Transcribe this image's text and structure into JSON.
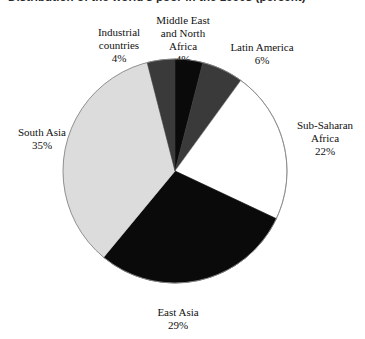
{
  "figure": {
    "title_clipped": "Distribution of the world's poor in the 1990s (percent)",
    "background_color": "#ffffff"
  },
  "chart_data": {
    "type": "pie",
    "title": "Distribution of the world's poor in the 1990s (percent)",
    "xlabel": "",
    "ylabel": "",
    "units": "percent",
    "total": 100,
    "start_angle_deg": 0,
    "direction": "clockwise",
    "legend": "none",
    "grid": false,
    "outline_color": "#888888",
    "categories": [
      "Middle East and North Africa",
      "Latin America",
      "Sub-Saharan Africa",
      "East Asia",
      "South Asia",
      "Industrial countries"
    ],
    "values": [
      4,
      6,
      22,
      29,
      35,
      4
    ],
    "colors": [
      "#0a0a0a",
      "#3a3a3a",
      "#ffffff",
      "#0a0a0a",
      "#dcdcdc",
      "#3a3a3a"
    ],
    "slices": [
      {
        "name": "middle-east-north-africa",
        "label_lines": [
          "Middle East",
          "and North",
          "Africa"
        ],
        "percent_text": "4%",
        "value": 4,
        "color": "#0a0a0a",
        "start_deg": 0,
        "end_deg": 14.4
      },
      {
        "name": "latin-america",
        "label_lines": [
          "Latin America"
        ],
        "percent_text": "6%",
        "value": 6,
        "color": "#3a3a3a",
        "start_deg": 14.4,
        "end_deg": 36.0
      },
      {
        "name": "sub-saharan-africa",
        "label_lines": [
          "Sub-Saharan",
          "Africa"
        ],
        "percent_text": "22%",
        "value": 22,
        "color": "#ffffff",
        "start_deg": 36.0,
        "end_deg": 115.2
      },
      {
        "name": "east-asia",
        "label_lines": [
          "East Asia"
        ],
        "percent_text": "29%",
        "value": 29,
        "color": "#0a0a0a",
        "start_deg": 115.2,
        "end_deg": 219.6
      },
      {
        "name": "south-asia",
        "label_lines": [
          "South Asia"
        ],
        "percent_text": "35%",
        "value": 35,
        "color": "#dcdcdc",
        "start_deg": 219.6,
        "end_deg": 345.6
      },
      {
        "name": "industrial-countries",
        "label_lines": [
          "Industrial",
          "countries"
        ],
        "percent_text": "4%",
        "value": 4,
        "color": "#3a3a3a",
        "start_deg": 345.6,
        "end_deg": 360.0
      }
    ]
  },
  "labels": {
    "industrial": {
      "line1": "Industrial",
      "line2": "countries",
      "pct": "4%"
    },
    "mena": {
      "line1": "Middle East",
      "line2": "and North",
      "line3": "Africa",
      "pct": "4%"
    },
    "latin": {
      "line1": "Latin America",
      "pct": "6%"
    },
    "ssa": {
      "line1": "Sub-Saharan",
      "line2": "Africa",
      "pct": "22%"
    },
    "south_asia": {
      "line1": "South Asia",
      "pct": "35%"
    },
    "east_asia": {
      "line1": "East Asia",
      "pct": "29%"
    }
  }
}
